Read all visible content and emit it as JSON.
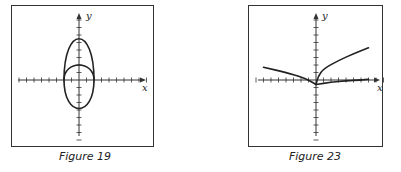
{
  "chart_data": [
    {
      "type": "line",
      "title": "Figure 19",
      "xlabel": "x",
      "ylabel": "y",
      "grid": false,
      "axis_ticks": {
        "x": [
          -8,
          -7,
          -6,
          -5,
          -4,
          -3,
          -2,
          -1,
          1,
          2,
          3,
          4,
          5,
          6,
          7,
          8,
          9
        ],
        "y": [
          -8,
          -7,
          -6,
          -5,
          -4,
          -3,
          -2,
          -1,
          1,
          2,
          3,
          4,
          5,
          6,
          7,
          8
        ]
      },
      "series": [
        {
          "name": "upper closed curve (tall arch)",
          "description": "curve from (-2,0) up to peak (0,6) down to (2,0)",
          "points": [
            [
              -2,
              0
            ],
            [
              -1.5,
              3.5
            ],
            [
              -1,
              5
            ],
            [
              0,
              6
            ],
            [
              1,
              5
            ],
            [
              1.5,
              3.5
            ],
            [
              2,
              0
            ]
          ]
        },
        {
          "name": "lower/inner ellipse",
          "description": "ellipse centered at origin, x-radius 2, top at y=2, bottom at y=-4",
          "points": [
            [
              -2,
              0
            ],
            [
              -1.4,
              1.5
            ],
            [
              0,
              2
            ],
            [
              1.4,
              1.5
            ],
            [
              2,
              0
            ],
            [
              1.7,
              -2.5
            ],
            [
              0,
              -4
            ],
            [
              -1.7,
              -2.5
            ],
            [
              -2,
              0
            ]
          ]
        }
      ],
      "xlim": [
        -8,
        9
      ],
      "ylim": [
        -8,
        8
      ]
    },
    {
      "type": "line",
      "title": "Figure 23",
      "xlabel": "x",
      "ylabel": "y",
      "grid": false,
      "axis_ticks": {
        "x": [
          -8,
          -7,
          -6,
          -5,
          -4,
          -3,
          -2,
          -1,
          1,
          2,
          3,
          4,
          5,
          6,
          7,
          8,
          9
        ],
        "y": [
          -8,
          -7,
          -6,
          -5,
          -4,
          -3,
          -2,
          -1,
          1,
          2,
          3,
          4,
          5,
          6,
          7,
          8
        ]
      },
      "series": [
        {
          "name": "left branch",
          "points": [
            [
              -7,
              1.7
            ],
            [
              -4,
              1
            ],
            [
              -2,
              0.4
            ],
            [
              -1,
              0
            ],
            [
              0,
              -0.6
            ]
          ]
        },
        {
          "name": "upper right branch",
          "points": [
            [
              0,
              -0.6
            ],
            [
              0.3,
              0.5
            ],
            [
              1,
              1.5
            ],
            [
              3,
              2.6
            ],
            [
              5,
              3.5
            ],
            [
              7,
              4.3
            ]
          ]
        },
        {
          "name": "lower right branch",
          "points": [
            [
              0,
              -0.6
            ],
            [
              2,
              -0.3
            ],
            [
              4,
              -0.1
            ],
            [
              6,
              0
            ],
            [
              7,
              0.1
            ]
          ]
        }
      ],
      "xlim": [
        -8,
        9
      ],
      "ylim": [
        -8,
        8
      ]
    }
  ],
  "figures": [
    {
      "caption": "Figure 19",
      "x_axis_label": "x",
      "y_axis_label": "y"
    },
    {
      "caption": "Figure 23",
      "x_axis_label": "x",
      "y_axis_label": "y"
    }
  ]
}
